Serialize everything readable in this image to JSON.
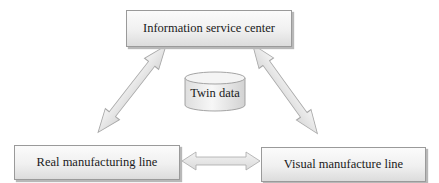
{
  "diagram": {
    "nodes": {
      "top": {
        "label": "Information service center"
      },
      "left": {
        "label": "Real manufacturing line"
      },
      "right": {
        "label": "Visual manufacture line"
      },
      "center": {
        "label": "Twin data",
        "shape": "cylinder-icon"
      }
    },
    "edges": [
      {
        "from": "Information service center",
        "to": "Real manufacturing line",
        "type": "bidirectional"
      },
      {
        "from": "Information service center",
        "to": "Visual manufacture line",
        "type": "bidirectional"
      },
      {
        "from": "Real manufacturing line",
        "to": "Visual manufacture line",
        "type": "bidirectional"
      }
    ],
    "colors": {
      "box_border": "#9a9a9a",
      "box_fill_top": "#fbfbfb",
      "box_fill_bottom": "#dcdcdc",
      "arrow_fill": "#e6e6e6",
      "arrow_stroke": "#a8a8a8",
      "text": "#1a1a1a"
    }
  }
}
